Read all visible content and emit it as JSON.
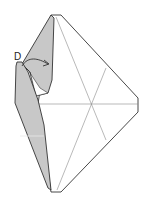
{
  "diagram": {
    "type": "origami-fold-step",
    "labels": [
      {
        "id": "point-d",
        "text": "D",
        "x": 14,
        "y": 52
      }
    ],
    "colors": {
      "paper_front": "#ffffff",
      "paper_back": "#c8c8c8",
      "outline": "#333333",
      "crease": "#8a8a8a"
    },
    "arrow": {
      "description": "fold point D to the right",
      "from": "D"
    }
  }
}
